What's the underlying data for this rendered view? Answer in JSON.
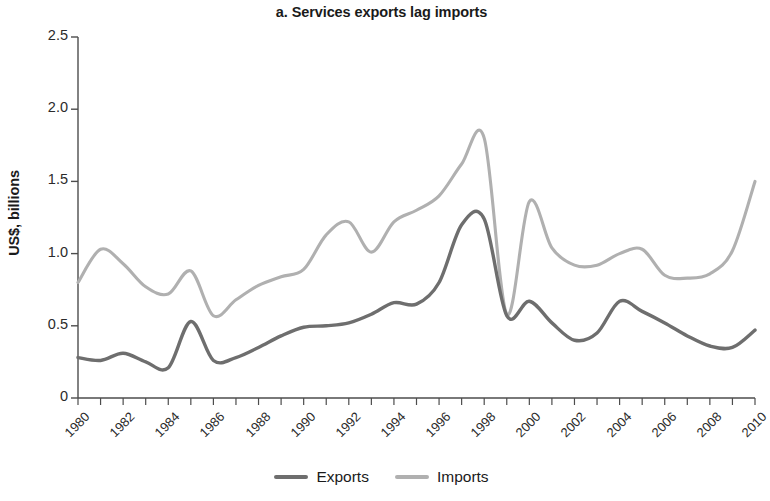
{
  "chart_data": {
    "type": "line",
    "title": "a. Services exports lag imports",
    "xlabel": "",
    "ylabel": "US$, billions",
    "ylim": [
      0,
      2.5
    ],
    "xlim": [
      1980,
      2010
    ],
    "yticks": [
      "0",
      "0.5",
      "1.0",
      "1.5",
      "2.0",
      "2.5"
    ],
    "ytick_values": [
      0,
      0.5,
      1.0,
      1.5,
      2.0,
      2.5
    ],
    "xticks": [
      "1980",
      "1982",
      "1984",
      "1986",
      "1988",
      "1990",
      "1992",
      "1994",
      "1996",
      "1998",
      "2000",
      "2002",
      "2004",
      "2006",
      "2008",
      "2010"
    ],
    "grid": false,
    "legend_position": "bottom-center",
    "x": [
      1980,
      1981,
      1982,
      1983,
      1984,
      1985,
      1986,
      1987,
      1988,
      1989,
      1990,
      1991,
      1992,
      1993,
      1994,
      1995,
      1996,
      1997,
      1998,
      1999,
      2000,
      2001,
      2002,
      2003,
      2004,
      2005,
      2006,
      2007,
      2008,
      2009,
      2010
    ],
    "series": [
      {
        "name": "Exports",
        "color": "#6e6e6e",
        "values": [
          0.28,
          0.26,
          0.31,
          0.25,
          0.21,
          0.53,
          0.26,
          0.28,
          0.35,
          0.43,
          0.49,
          0.5,
          0.52,
          0.58,
          0.66,
          0.65,
          0.8,
          1.2,
          1.24,
          0.57,
          0.67,
          0.52,
          0.4,
          0.45,
          0.67,
          0.6,
          0.52,
          0.43,
          0.36,
          0.35,
          0.47
        ]
      },
      {
        "name": "Imports",
        "color": "#b0b0b0",
        "values": [
          0.8,
          1.03,
          0.93,
          0.77,
          0.72,
          0.88,
          0.57,
          0.68,
          0.78,
          0.84,
          0.89,
          1.13,
          1.22,
          1.01,
          1.22,
          1.3,
          1.4,
          1.62,
          1.8,
          0.58,
          1.36,
          1.04,
          0.92,
          0.92,
          1.0,
          1.03,
          0.85,
          0.83,
          0.86,
          1.02,
          1.5
        ]
      }
    ]
  },
  "legend": {
    "entries": [
      {
        "label": "Exports",
        "color": "#6e6e6e"
      },
      {
        "label": "Imports",
        "color": "#b0b0b0"
      }
    ]
  }
}
